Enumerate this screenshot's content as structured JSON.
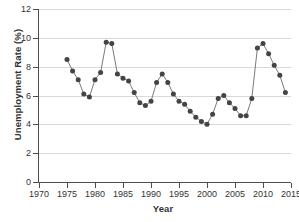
{
  "chart_data": {
    "type": "line",
    "title": "",
    "xlabel": "Year",
    "ylabel": "Unemployment Rate (%)",
    "xlim": [
      1970,
      2015
    ],
    "ylim": [
      0,
      12
    ],
    "xticks": [
      1970,
      1975,
      1980,
      1985,
      1990,
      1995,
      2000,
      2005,
      2010,
      2015
    ],
    "yticks": [
      0,
      2,
      4,
      6,
      8,
      10,
      12
    ],
    "grid": "horizontal",
    "legend": "none",
    "marker": "filled-circle",
    "marker_color": "#444444",
    "line_color": "#6b6b6b",
    "x": [
      1975,
      1976,
      1977,
      1978,
      1979,
      1980,
      1981,
      1982,
      1983,
      1984,
      1985,
      1986,
      1987,
      1988,
      1989,
      1990,
      1991,
      1992,
      1993,
      1994,
      1995,
      1996,
      1997,
      1998,
      1999,
      2000,
      2001,
      2002,
      2003,
      2004,
      2005,
      2006,
      2007,
      2008,
      2009,
      2010,
      2011,
      2012,
      2013,
      2014
    ],
    "values": [
      8.5,
      7.7,
      7.1,
      6.1,
      5.9,
      7.1,
      7.6,
      9.7,
      9.6,
      7.5,
      7.2,
      7.0,
      6.2,
      5.5,
      5.3,
      5.6,
      6.9,
      7.5,
      6.9,
      6.1,
      5.6,
      5.4,
      4.9,
      4.5,
      4.2,
      4.0,
      4.7,
      5.8,
      6.0,
      5.5,
      5.1,
      4.6,
      4.6,
      5.8,
      9.3,
      9.6,
      8.9,
      8.1,
      7.4,
      6.2
    ]
  }
}
